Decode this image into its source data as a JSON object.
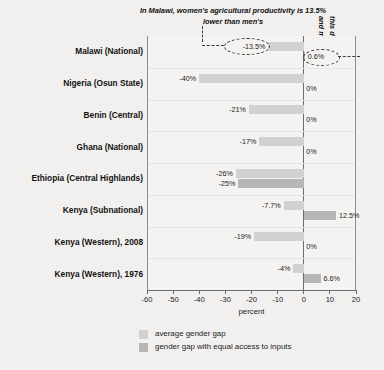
{
  "annotations": {
    "top": "In Malawi, women's agricultural productivity is 13.5% lower than men's",
    "right_line1": "this difference disappears when women",
    "right_line2": "and men have equal access to inputs"
  },
  "legend": {
    "items": [
      {
        "label": "average gender gap",
        "color": "#d2d1cf",
        "swatch": "light"
      },
      {
        "label": "gender gap with equal access to inputs",
        "color": "#b7b6b4",
        "swatch": "dark"
      }
    ]
  },
  "axis": {
    "title": "percent",
    "ticks": [
      "-60",
      "-50",
      "-40",
      "-30",
      "-20",
      "-10",
      "0",
      "10",
      "20"
    ]
  },
  "chart_data": {
    "type": "bar",
    "title": "",
    "xlabel": "percent",
    "ylabel": "",
    "xlim": [
      -60,
      20
    ],
    "xticks": [
      -60,
      -50,
      -40,
      -30,
      -20,
      -10,
      0,
      10,
      20
    ],
    "grid": false,
    "orientation": "horizontal",
    "legend_position": "bottom",
    "categories": [
      "Malawi  (National)",
      "Nigeria (Osun State)",
      "Benin (Central)",
      "Ghana (National)",
      "Ethiopia (Central Highlands)",
      "Kenya (Subnational)",
      "Kenya (Western), 2008",
      "Kenya (Western), 1976"
    ],
    "series": [
      {
        "name": "average gender gap",
        "color": "#d2d1cf",
        "values": [
          -13.5,
          -40,
          -21,
          -17,
          -26,
          -7.7,
          -19,
          -4
        ],
        "labels": [
          "-13.5%",
          "-40%",
          "-21%",
          "-17%",
          "-26%",
          "-7.7%",
          "-19%",
          "-4%"
        ]
      },
      {
        "name": "gender gap with equal access to inputs",
        "color": "#b7b6b4",
        "values": [
          0.6,
          0,
          0,
          0,
          -25,
          12.5,
          0,
          6.6
        ],
        "labels": [
          "0.6%",
          "0%",
          "0%",
          "0%",
          "-25%",
          "12.5%",
          "0%",
          "6.6%"
        ]
      }
    ],
    "callouts": [
      {
        "target": "Malawi average gender gap",
        "value": "-13.5%"
      },
      {
        "target": "Malawi gender gap with equal access to inputs",
        "value": "0.6%"
      }
    ]
  }
}
